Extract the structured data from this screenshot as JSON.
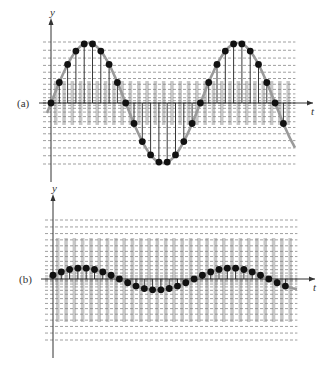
{
  "figure": {
    "panels": [
      {
        "id": "a",
        "label": "(a)",
        "y_axis_label": "y",
        "t_axis_label": "t",
        "axis_origin": [
          51,
          103
        ],
        "axis_x_end": 313,
        "axis_y_top": 22,
        "axis_y_bottom": 182,
        "amplitude_px": 60,
        "period_samples": 18,
        "sample_count": 29,
        "sample_spacing_px": 8.3,
        "phase_offset": 0,
        "grid_top": 42,
        "grid_bottom": 164,
        "grid_levels": 24
      },
      {
        "id": "b",
        "label": "(b)",
        "y_axis_label": "y",
        "t_axis_label": "t",
        "axis_origin": [
          53,
          279
        ],
        "axis_x_end": 315,
        "axis_y_top": 198,
        "axis_y_bottom": 358,
        "amplitude_px": 11,
        "period_samples": 18,
        "sample_count": 29,
        "sample_spacing_px": 8.3,
        "phase_offset": 0.35,
        "grid_top": 220,
        "grid_bottom": 340,
        "grid_levels": 28
      }
    ],
    "colors": {
      "curve": "#9a9a9a",
      "dots": "#111111",
      "stems": "#222222",
      "grid": "#777777",
      "shade": "#c8c8c8",
      "axis": "#333333"
    }
  }
}
